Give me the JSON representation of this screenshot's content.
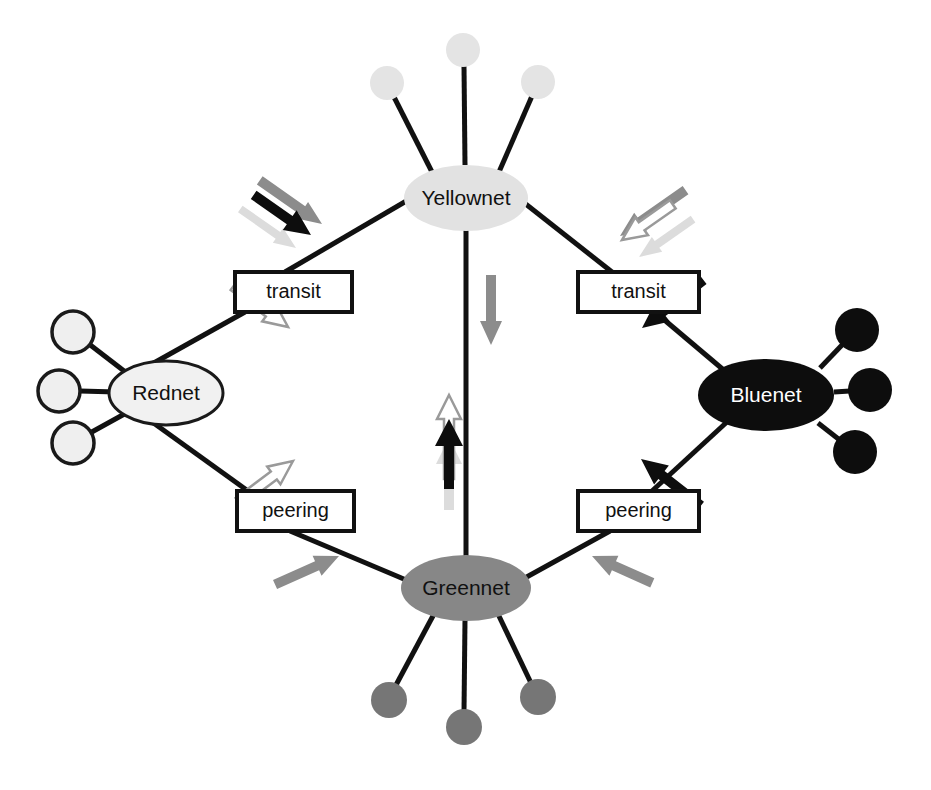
{
  "diagram": {
    "canvas": {
      "width": 931,
      "height": 790,
      "background": "#ffffff"
    },
    "networks": [
      {
        "id": "yellownet",
        "label": "Yellownet",
        "position": {
          "cx": 466,
          "cy": 198
        },
        "ellipse": {
          "rx": 62,
          "ry": 33
        },
        "fill": "#e2e2e2",
        "stroke": "none",
        "text_color": "#111111",
        "customers": [
          {
            "cx": 387,
            "cy": 83,
            "r": 17,
            "fill": "#e4e4e4",
            "stroke": "none"
          },
          {
            "cx": 463,
            "cy": 50,
            "r": 17,
            "fill": "#e4e4e4",
            "stroke": "none"
          },
          {
            "cx": 538,
            "cy": 82,
            "r": 17,
            "fill": "#e4e4e4",
            "stroke": "none"
          }
        ]
      },
      {
        "id": "rednet",
        "label": "Rednet",
        "position": {
          "cx": 166,
          "cy": 393
        },
        "ellipse": {
          "rx": 57,
          "ry": 32
        },
        "fill": "#f1f1f1",
        "stroke": "#1a1a1a",
        "text_color": "#111111",
        "customers": [
          {
            "cx": 73,
            "cy": 332,
            "r": 21,
            "fill": "#efefef",
            "stroke": "#1a1a1a"
          },
          {
            "cx": 59,
            "cy": 391,
            "r": 21,
            "fill": "#efefef",
            "stroke": "#1a1a1a"
          },
          {
            "cx": 73,
            "cy": 443,
            "r": 21,
            "fill": "#efefef",
            "stroke": "#1a1a1a"
          }
        ]
      },
      {
        "id": "bluenet",
        "label": "Bluenet",
        "position": {
          "cx": 766,
          "cy": 395
        },
        "ellipse": {
          "rx": 68,
          "ry": 36
        },
        "fill": "#0d0d0d",
        "stroke": "none",
        "text_color": "#ffffff",
        "customers": [
          {
            "cx": 857,
            "cy": 330,
            "r": 22,
            "fill": "#0d0d0d",
            "stroke": "none"
          },
          {
            "cx": 870,
            "cy": 390,
            "r": 22,
            "fill": "#0d0d0d",
            "stroke": "none"
          },
          {
            "cx": 855,
            "cy": 452,
            "r": 22,
            "fill": "#0d0d0d",
            "stroke": "none"
          }
        ]
      },
      {
        "id": "greennet",
        "label": "Greennet",
        "position": {
          "cx": 466,
          "cy": 588
        },
        "ellipse": {
          "rx": 65,
          "ry": 33
        },
        "fill": "#878787",
        "stroke": "none",
        "text_color": "#111111",
        "customers": [
          {
            "cx": 389,
            "cy": 700,
            "r": 18,
            "fill": "#767676",
            "stroke": "none"
          },
          {
            "cx": 464,
            "cy": 727,
            "r": 18,
            "fill": "#767676",
            "stroke": "none"
          },
          {
            "cx": 538,
            "cy": 697,
            "r": 18,
            "fill": "#767676",
            "stroke": "none"
          }
        ]
      }
    ],
    "relationship_boxes": [
      {
        "id": "transit-left",
        "label": "transit",
        "x": 235,
        "y": 272,
        "width": 117,
        "height": 40
      },
      {
        "id": "transit-right",
        "label": "transit",
        "x": 578,
        "y": 272,
        "width": 121,
        "height": 40
      },
      {
        "id": "peering-left",
        "label": "peering",
        "x": 237,
        "y": 491,
        "width": 117,
        "height": 40
      },
      {
        "id": "peering-right",
        "label": "peering",
        "x": 578,
        "y": 491,
        "width": 121,
        "height": 40
      }
    ],
    "connections": [
      {
        "from": "rednet",
        "to": "transit-left",
        "type": "transit"
      },
      {
        "from": "transit-left",
        "to": "yellownet",
        "type": "transit"
      },
      {
        "from": "bluenet",
        "to": "transit-right",
        "type": "transit"
      },
      {
        "from": "transit-right",
        "to": "yellownet",
        "type": "transit"
      },
      {
        "from": "rednet",
        "to": "peering-left",
        "type": "peering"
      },
      {
        "from": "peering-left",
        "to": "greennet",
        "type": "peering"
      },
      {
        "from": "bluenet",
        "to": "peering-right",
        "type": "peering"
      },
      {
        "from": "peering-right",
        "to": "greennet",
        "type": "peering"
      },
      {
        "from": "yellownet",
        "to": "greennet",
        "type": "backbone"
      }
    ],
    "traffic_flows": [
      {
        "id": "flow-red-up",
        "source_network": "rednet",
        "color": "#ffffff",
        "outline": "#9a9a9a",
        "direction": "up-right",
        "description": "Rednet traffic toward left transit"
      },
      {
        "id": "flow-red-down",
        "source_network": "rednet",
        "color": "#ffffff",
        "outline": "#9a9a9a",
        "direction": "down-right",
        "description": "Rednet traffic toward left peering"
      },
      {
        "id": "flow-blue-up",
        "source_network": "bluenet",
        "color": "#0d0d0d",
        "outline": "none",
        "direction": "up-left",
        "description": "Bluenet traffic toward right transit"
      },
      {
        "id": "flow-blue-down",
        "source_network": "bluenet",
        "color": "#0d0d0d",
        "outline": "none",
        "direction": "down-left",
        "description": "Bluenet traffic toward right peering"
      },
      {
        "id": "flow-green-left",
        "source_network": "greennet",
        "color": "#8c8c8c",
        "outline": "none",
        "direction": "up-left",
        "description": "Greennet traffic toward left peering"
      },
      {
        "id": "flow-green-right",
        "source_network": "greennet",
        "color": "#8c8c8c",
        "outline": "none",
        "direction": "up-right",
        "description": "Greennet traffic toward right peering"
      },
      {
        "id": "flow-yellow-left-gray",
        "source_network": "yellownet",
        "color": "#8c8c8c",
        "outline": "none",
        "direction": "down-left",
        "description": "Transit traffic arriving at left transit link"
      },
      {
        "id": "flow-yellow-left-black",
        "source_network": "bluenet",
        "color": "#0d0d0d",
        "outline": "none",
        "direction": "down-left",
        "description": "Bluenet traffic transiting to Rednet"
      },
      {
        "id": "flow-yellow-left-pale",
        "source_network": "rednet",
        "color": "#dcdcdc",
        "outline": "none",
        "direction": "down-left",
        "description": "Return traffic toward Rednet"
      },
      {
        "id": "flow-yellow-right-gray",
        "source_network": "greennet",
        "color": "#8c8c8c",
        "outline": "none",
        "direction": "down-right",
        "description": "Greennet traffic transiting to Bluenet"
      },
      {
        "id": "flow-yellow-right-white",
        "source_network": "rednet",
        "color": "#ffffff",
        "outline": "#9a9a9a",
        "direction": "down-right",
        "description": "Rednet traffic transiting to Bluenet"
      },
      {
        "id": "flow-yellow-right-pale",
        "source_network": "yellownet",
        "color": "#dcdcdc",
        "outline": "none",
        "direction": "down-right",
        "description": "Faint return traffic toward Bluenet"
      },
      {
        "id": "flow-center-white",
        "source_network": "rednet",
        "color": "#ffffff",
        "outline": "#9a9a9a",
        "direction": "down",
        "description": "Rednet traffic down the backbone"
      },
      {
        "id": "flow-center-black",
        "source_network": "bluenet",
        "color": "#0d0d0d",
        "outline": "none",
        "direction": "down",
        "description": "Bluenet traffic down the backbone"
      },
      {
        "id": "flow-center-pale",
        "source_network": "yellownet",
        "color": "#dcdcdc",
        "outline": "none",
        "direction": "down",
        "description": "Faint traffic down the backbone"
      },
      {
        "id": "flow-center-up-gray",
        "source_network": "greennet",
        "color": "#8c8c8c",
        "outline": "none",
        "direction": "up",
        "description": "Greennet traffic up the backbone"
      }
    ]
  }
}
